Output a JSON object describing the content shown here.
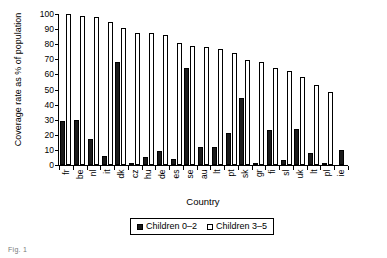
{
  "chart_data": {
    "type": "bar",
    "title": "",
    "xlabel": "Country",
    "ylabel": "Coverage rate as % of population",
    "ylim": [
      0,
      100
    ],
    "ytick_values": [
      100,
      90,
      80,
      70,
      60,
      50,
      40,
      30,
      20,
      10,
      0
    ],
    "ytick_labels": [
      "100",
      "90",
      "80",
      "70",
      "60",
      "50",
      "40",
      "30",
      "20",
      "10",
      "0"
    ],
    "grid": false,
    "legend_position": "below-axes",
    "categories": [
      "fr",
      "be",
      "nl",
      "it",
      "dk",
      "cz",
      "hu",
      "de",
      "es",
      "se",
      "au",
      "lt",
      "pt",
      "sk",
      "gr",
      "fi",
      "sl",
      "uk",
      "lt",
      "pl",
      "ie"
    ],
    "series": [
      {
        "name": "Children 0–2",
        "color": "#1a1a1a",
        "values": [
          29,
          30,
          17,
          6,
          68,
          1.5,
          5,
          9.5,
          4,
          64.5,
          12,
          12,
          21,
          44.5,
          1.5,
          23.5,
          3,
          24,
          8,
          0.5,
          10
        ]
      },
      {
        "name": "Children 3–5",
        "color": "#ffffff",
        "values": [
          100,
          99,
          98,
          95,
          90.5,
          87.5,
          87.5,
          86,
          80.5,
          79,
          78,
          77,
          74,
          69.5,
          68.5,
          64.5,
          62.5,
          58,
          53,
          48.5,
          0
        ]
      }
    ]
  },
  "axes": {
    "y_title": "Coverage rate as % of population",
    "x_title": "Country"
  },
  "legend": {
    "items": [
      {
        "label": "Children 0–2",
        "style": "dark"
      },
      {
        "label": "Children 3–5",
        "style": "light"
      }
    ]
  },
  "caption": {
    "text": "Fig. 1"
  }
}
